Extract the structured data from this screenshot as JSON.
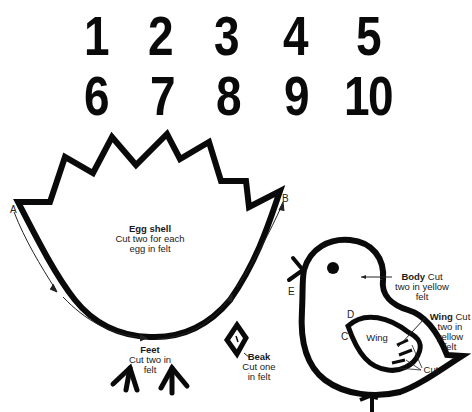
{
  "numbers": [
    "1",
    "2",
    "3",
    "4",
    "5",
    "6",
    "7",
    "8",
    "9",
    "10"
  ],
  "egg_shell": {
    "title": "Egg shell",
    "line1": "Cut two for each",
    "line2": "egg in felt",
    "point_a": "A",
    "point_b": "B"
  },
  "feet": {
    "title": "Feet",
    "line1": "Cut two in",
    "line2": "felt"
  },
  "beak": {
    "title": "Beak",
    "line1": "Cut one",
    "line2": "in felt"
  },
  "body": {
    "title": "Body",
    "suffix": " Cut",
    "line1": "two in yellow",
    "line2": "felt",
    "point_e": "E"
  },
  "wing": {
    "title": "Wing",
    "suffix": " Cut",
    "line1": "two in",
    "line2": "yellow",
    "line3": "felt",
    "inner": "Wing",
    "point_c": "C",
    "point_d": "D",
    "cut_label": "Cut"
  },
  "colors": {
    "ink": "#0a0a0a",
    "paper": "#ffffff"
  }
}
